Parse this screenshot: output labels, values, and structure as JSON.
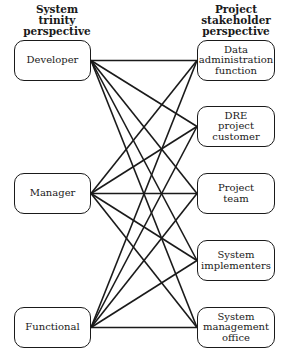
{
  "headers": {
    "left": "System\ntrinity\nperspective",
    "right": "Project\nstakeholder\nperspective"
  },
  "left_nodes": [
    {
      "label": "Developer"
    },
    {
      "label": "Manager"
    },
    {
      "label": "Functional"
    }
  ],
  "right_nodes": [
    {
      "label": "Data\nadministration\nfunction"
    },
    {
      "label": "DRE\nproject\ncustomer"
    },
    {
      "label": "Project\nteam"
    },
    {
      "label": "System\nimplementers"
    },
    {
      "label": "System\nmanagement\noffice"
    }
  ],
  "edges": "every left node connects to every right node (15 lines)"
}
